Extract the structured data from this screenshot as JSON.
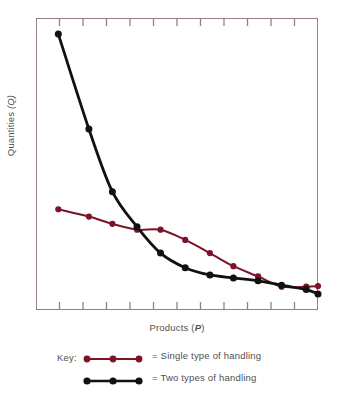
{
  "chart_data": {
    "type": "line",
    "title": "",
    "xlabel": "Products (P)",
    "xlabel_plain": "Products",
    "xlabel_symbol": "P",
    "ylabel": "Quantities (Q)",
    "ylabel_plain": "Quantities",
    "ylabel_symbol": "Q",
    "grid": false,
    "xlim": [
      0,
      12
    ],
    "ylim": [
      0,
      100
    ],
    "x_tick_count": 11,
    "axis_tick_direction": "inward",
    "axes_visible": [
      "top",
      "bottom",
      "left",
      "right"
    ],
    "x": [
      0.95,
      2.25,
      3.25,
      4.3,
      5.3,
      6.35,
      7.4,
      8.4,
      9.45,
      10.45,
      11.5,
      12.0
    ],
    "series": [
      {
        "name": "Single type of handling",
        "key": "single",
        "color": "#7d1228",
        "marker": "circle",
        "values": [
          34.5,
          32.0,
          29.5,
          27.5,
          27.5,
          24.0,
          19.5,
          15.0,
          11.5,
          8.0,
          8.0,
          8.2
        ]
      },
      {
        "name": "Two types of handling",
        "key": "two",
        "color": "#111111",
        "marker": "circle",
        "values": [
          94.5,
          62.0,
          40.5,
          28.5,
          19.5,
          14.5,
          12.0,
          11.0,
          10.0,
          8.5,
          7.0,
          5.5
        ]
      }
    ],
    "legend": {
      "position": "bottom",
      "key_label": "Key:",
      "entries": [
        {
          "equals": "=",
          "label": "Single type of handling",
          "color": "#7d1228"
        },
        {
          "equals": "=",
          "label": "Two types of handling",
          "color": "#111111"
        }
      ]
    },
    "colors": {
      "frame": "#9c7d87",
      "single_handling": "#7d1228",
      "two_handling": "#111111",
      "background": "#ffffff",
      "text": "#4f4f4f"
    }
  }
}
